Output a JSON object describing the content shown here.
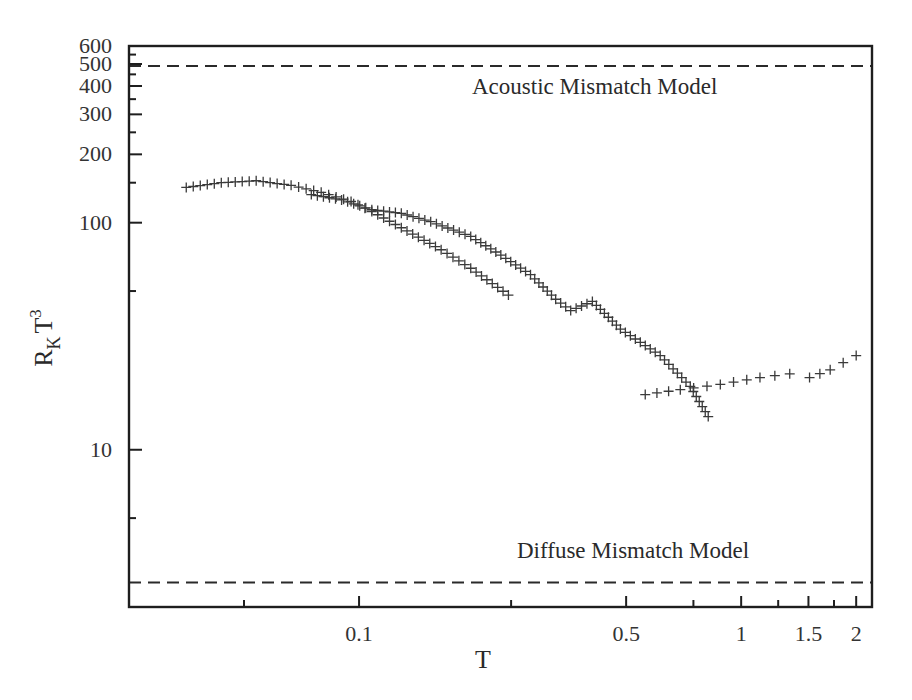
{
  "chart_data": {
    "type": "scatter",
    "title": "",
    "xlabel": "T",
    "ylabel": "R_K T^3",
    "xscale": "log",
    "yscale": "log",
    "xlim": [
      0.025,
      2.2
    ],
    "ylim": [
      2.03,
      600
    ],
    "grid": false,
    "legend": null,
    "x_ticks": [
      {
        "value": 0.05,
        "label": ""
      },
      {
        "value": 0.1,
        "label": "0.1"
      },
      {
        "value": 0.25,
        "label": ""
      },
      {
        "value": 0.5,
        "label": "0.5"
      },
      {
        "value": 0.75,
        "label": ""
      },
      {
        "value": 1,
        "label": "1"
      },
      {
        "value": 1.25,
        "label": ""
      },
      {
        "value": 1.5,
        "label": "1.5"
      },
      {
        "value": 1.75,
        "label": ""
      },
      {
        "value": 2,
        "label": "2"
      }
    ],
    "y_ticks": [
      {
        "value": 5,
        "label": ""
      },
      {
        "value": 10,
        "label": "10"
      },
      {
        "value": 50,
        "label": ""
      },
      {
        "value": 100,
        "label": "100"
      },
      {
        "value": 150,
        "label": ""
      },
      {
        "value": 200,
        "label": "200"
      },
      {
        "value": 250,
        "label": ""
      },
      {
        "value": 300,
        "label": "300"
      },
      {
        "value": 350,
        "label": ""
      },
      {
        "value": 400,
        "label": "400"
      },
      {
        "value": 450,
        "label": ""
      },
      {
        "value": 500,
        "label": "500"
      },
      {
        "value": 550,
        "label": ""
      },
      {
        "value": 600,
        "label": "600"
      }
    ],
    "reference_lines": [
      {
        "name": "Acoustic Mismatch Model",
        "y": 490,
        "style": "dashed",
        "label_x": 0.26,
        "label_y": 380
      },
      {
        "name": "Diffuse Mismatch Model",
        "y": 2.6,
        "style": "dashed",
        "label_x": 0.29,
        "label_y": 3.4
      }
    ],
    "series": [
      {
        "name": "series-1",
        "marker": "+",
        "x": [
          0.0353,
          0.0436,
          0.0538,
          0.0664,
          0.0796,
          0.0953,
          0.108,
          0.129,
          0.164,
          0.196,
          0.246
        ],
        "y": [
          143,
          150,
          153,
          146,
          136,
          124,
          112,
          95,
          76,
          63,
          48
        ]
      },
      {
        "name": "series-2",
        "marker": "+",
        "x": [
          0.075,
          0.09,
          0.108,
          0.129,
          0.154,
          0.196,
          0.235,
          0.281,
          0.327,
          0.358,
          0.408,
          0.483,
          0.614,
          0.736,
          0.82
        ],
        "y": [
          133,
          126,
          114,
          110,
          101,
          87,
          72,
          59,
          46,
          41,
          45,
          34,
          26,
          19,
          14
        ]
      },
      {
        "name": "series-3",
        "marker": "+",
        "x": [
          0.561,
          0.693,
          0.882,
          1.12,
          1.34,
          1.51,
          1.71,
          2.0
        ],
        "y": [
          17.5,
          18.4,
          19.4,
          20.8,
          21.6,
          20.8,
          22.5,
          26
        ]
      }
    ]
  },
  "annotations": {
    "amm_label": "Acoustic Mismatch Model",
    "dmm_label": "Diffuse Mismatch Model"
  },
  "axes": {
    "x_title": "T",
    "y_title_main": "R",
    "y_title_sub": "K",
    "y_title_var": "T",
    "y_title_sup": "3"
  },
  "colors": {
    "axis": "#1e1e1e",
    "marker": "#3a3a3a",
    "dashed": "#2a2a2a"
  }
}
